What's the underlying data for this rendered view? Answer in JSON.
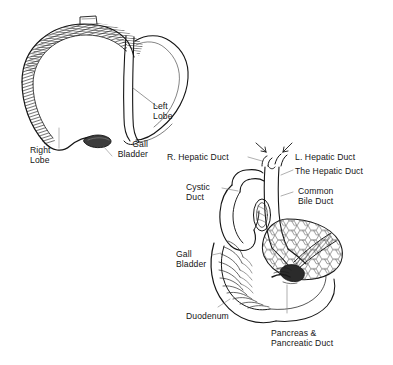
{
  "figure": {
    "background_color": "#ffffff",
    "ink_color": "#151515",
    "panels": [
      {
        "name": "liver-overview",
        "description": "Anterior view of the liver showing right lobe, left lobe and gall bladder"
      },
      {
        "name": "biliary-tree",
        "description": "Gall bladder, cystic duct, hepatic ducts, common bile duct, duodenum and pancreas"
      }
    ]
  },
  "liver_panel": {
    "labels": {
      "left_lobe": "Left\nLobe",
      "right_lobe": "Right\nLobe",
      "gall_bladder": "Gall\nBladder"
    }
  },
  "biliary_panel": {
    "labels": {
      "right_hepatic_duct": "R. Hepatic Duct",
      "left_hepatic_duct": "L. Hepatic Duct",
      "the_hepatic_duct": "The Hepatic Duct",
      "cystic_duct": "Cystic\nDuct",
      "common_bile_duct": "Common\nBile Duct",
      "gall_bladder": "Gall\nBladder",
      "duodenum": "Duodenum",
      "pancreas": "Pancreas &\nPancreatic Duct"
    }
  }
}
